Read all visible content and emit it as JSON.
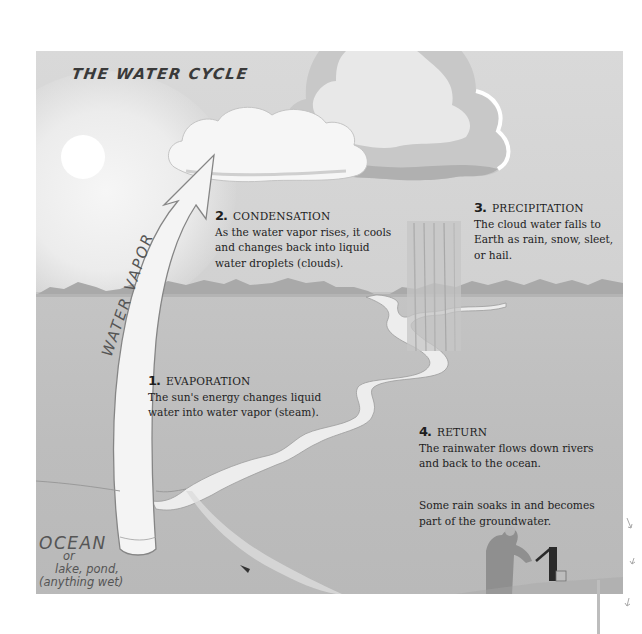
{
  "diagram": {
    "title": "THE WATER CYCLE",
    "colors": {
      "sky": "#d6d6d6",
      "ground": "#bebebe",
      "cloud": "#f4f4f4",
      "cloud_shadow": "#a9a9a9",
      "arrow_fill": "#f3f3f3",
      "arrow_stroke": "#8a8a8a",
      "river": "#ededed",
      "text": "#1e1e1e",
      "handwriting": "#555555"
    },
    "arrow_label": "WATER VAPOR",
    "water_body_label": {
      "main": "OCEAN",
      "lines": [
        "or",
        "lake, pond,",
        "(anything wet)"
      ]
    },
    "steps": [
      {
        "number": "1.",
        "title": "EVAPORATION",
        "lines": [
          "The sun's energy changes liquid",
          "water into water vapor (steam)."
        ]
      },
      {
        "number": "2.",
        "title": "CONDENSATION",
        "lines": [
          "As the water vapor rises, it cools",
          "and changes back into liquid",
          "water droplets (clouds)."
        ]
      },
      {
        "number": "3.",
        "title": "PRECIPITATION",
        "lines": [
          "The cloud water falls to",
          "Earth as rain, snow, sleet,",
          "or hail."
        ]
      },
      {
        "number": "4.",
        "title": "RETURN",
        "lines": [
          "The rainwater flows down rivers",
          "and back to the ocean."
        ]
      }
    ],
    "groundwater_note": {
      "lines": [
        "Some rain soaks in and becomes",
        "part of the groundwater."
      ]
    },
    "illustrations": [
      "sun-icon",
      "cloud-icon",
      "storm-cloud-icon",
      "rain-shaft-icon",
      "mountains-icon",
      "river-icon",
      "water-vapor-arrow-icon",
      "person-at-pump-icon",
      "water-pump-icon",
      "fish-icon",
      "groundwater-arrows-icon"
    ]
  }
}
